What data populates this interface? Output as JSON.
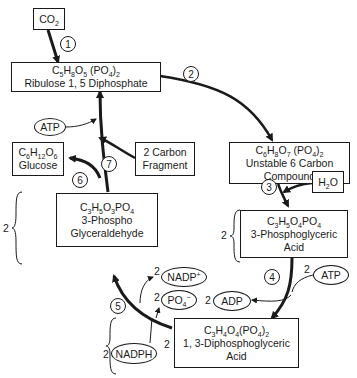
{
  "diagram": {
    "nodes": {
      "co2": {
        "label": "CO",
        "sub": "2"
      },
      "rudp": {
        "formula": {
          "p1": "C",
          "s1": "5",
          "p2": "H",
          "s2": "8",
          "p3": "O",
          "s3": "5",
          "p4": " (PO",
          "s4": "4",
          "p5": ")",
          "s5": "2"
        },
        "name": "Ribulose 1, 5 Diphosphate"
      },
      "unstable": {
        "formula": {
          "p1": "C",
          "s1": "6",
          "p2": "H",
          "s2": "8",
          "p3": "O",
          "s3": "7",
          "p4": " (PO",
          "s4": "4",
          "p5": ")",
          "s5": "2"
        },
        "name1": "Unstable 6 Carbon",
        "name2": "Compound"
      },
      "h2o": {
        "p1": "H",
        "s1": "2",
        "p2": "O"
      },
      "pga": {
        "formula": {
          "p1": "C",
          "s1": "3",
          "p2": "H",
          "s2": "5",
          "p3": "O",
          "s3": "4",
          "p4": "PO",
          "s4": "4"
        },
        "name1": "3-Phosphoglyceric",
        "name2": "Acid",
        "coef": "2"
      },
      "dpga": {
        "formula": {
          "p1": "C",
          "s1": "3",
          "p2": "H",
          "s2": "4",
          "p3": "O",
          "s3": "4",
          "p4": "(PO",
          "s4": "4",
          "p5": ")",
          "s5": "2"
        },
        "name1": "1, 3-Diphosphoglyceric",
        "name2": "Acid",
        "coef": "2"
      },
      "pgal": {
        "formula": {
          "p1": "C",
          "s1": "3",
          "p2": "H",
          "s2": "5",
          "p3": "O",
          "s3": "3",
          "p4": "PO",
          "s4": "4"
        },
        "name1": "3-Phospho",
        "name2": "Glyceraldehyde",
        "coef": "2"
      },
      "glucose": {
        "formula": {
          "p1": "C",
          "s1": "6",
          "p2": "H",
          "s2": "12",
          "p3": "O",
          "s3": "6"
        },
        "name": "Glucose"
      },
      "carbon_fragment": {
        "line1": "2 Carbon",
        "line2": "Fragment"
      }
    },
    "ovals": {
      "atp_top": "ATP",
      "atp_right": "ATP",
      "atp_right_coef": "2",
      "adp": "ADP",
      "adp_coef": "2",
      "nadp": "NADP",
      "nadp_sup": "+",
      "nadp_coef": "2",
      "po4": "PO",
      "po4_sub": "4",
      "po4_sup": "−",
      "po4_coef": "2",
      "nadph": "NADPH",
      "nadph_coef": "2"
    },
    "steps": [
      "1",
      "2",
      "3",
      "4",
      "5",
      "6",
      "7"
    ],
    "colors": {
      "ink": "#1a1a1a",
      "background": "#ffffff"
    }
  }
}
